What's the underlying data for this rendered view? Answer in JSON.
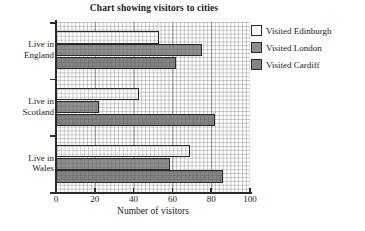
{
  "chart_data": {
    "type": "bar",
    "orientation": "horizontal",
    "title": "Chart showing visitors to cities",
    "xlabel": "Number of visitors",
    "ylabel": "",
    "xlim": [
      0,
      100
    ],
    "xticks": [
      "0",
      "20",
      "40",
      "60",
      "80",
      "100"
    ],
    "minor_grid_step": 2,
    "grid": true,
    "legend_position": "right",
    "categories": [
      "Live in England",
      "Live in Scotland",
      "Live in Wales"
    ],
    "series": [
      {
        "name": "Visited Edinburgh",
        "color": "#fdfdfd",
        "values": [
          53,
          43,
          69
        ]
      },
      {
        "name": "Visited London",
        "color": "#8e8e8e",
        "values": [
          75,
          22,
          59
        ]
      },
      {
        "name": "Visited Cardiff",
        "color": "#848484",
        "values": [
          62,
          82,
          86
        ]
      }
    ]
  },
  "axis": {
    "x_title": "Number of visitors",
    "tick_labels": [
      "0",
      "20",
      "40",
      "60",
      "80",
      "100"
    ]
  },
  "category_labels": [
    {
      "line1": "Live in",
      "line2": "England"
    },
    {
      "line1": "Live in",
      "line2": "Scotland"
    },
    {
      "line1": "Live in",
      "line2": "Wales"
    }
  ],
  "legend": {
    "items": [
      {
        "label": "Visited Edinburgh",
        "color": "#fdfdfd"
      },
      {
        "label": "Visited London",
        "color": "#8e8e8e"
      },
      {
        "label": "Visited Cardiff",
        "color": "#848484"
      }
    ]
  },
  "colors": {
    "axis": "#2b2b2b",
    "grid": "#787878",
    "background": "#ffffff",
    "text": "#1a1a1a"
  }
}
